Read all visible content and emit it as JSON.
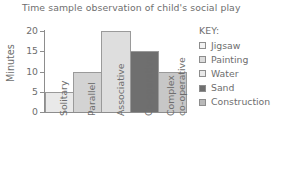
{
  "chart_data": {
    "type": "bar",
    "title": "Time sample observation of child's social play",
    "xlabel": "",
    "ylabel": "Minutes",
    "ylim": [
      0,
      20
    ],
    "yticks": [
      "0",
      "5",
      "10",
      "15",
      "20"
    ],
    "grid": false,
    "legend_position": "right",
    "categories": [
      "Solitary",
      "Parallel",
      "Associative",
      "Co-operative",
      "Complex co-operative"
    ],
    "category_lines": [
      [
        "Solitary"
      ],
      [
        "Parallel"
      ],
      [
        "Associative"
      ],
      [
        "Co-operative"
      ],
      [
        "Complex",
        "co-operative"
      ]
    ],
    "values": [
      5,
      10,
      20,
      15,
      10
    ],
    "bar_colors": [
      "#e9e9e9",
      "#d3d3d3",
      "#dedede",
      "#6f6f6f",
      "#c7c7c7"
    ],
    "bar_border_color": "#9a9a9a",
    "legend": {
      "title": "KEY:",
      "entries": [
        {
          "label": "Jigsaw",
          "color": "#f2f2f2"
        },
        {
          "label": "Painting",
          "color": "#dcdcdc"
        },
        {
          "label": "Water",
          "color": "#e9e9e9"
        },
        {
          "label": "Sand",
          "color": "#6f6f6f"
        },
        {
          "label": "Construction",
          "color": "#b9b9b9"
        }
      ]
    }
  },
  "colors": {
    "axis": "#8d8d8d",
    "text": "#6e6e6e",
    "background": "#ffffff"
  }
}
